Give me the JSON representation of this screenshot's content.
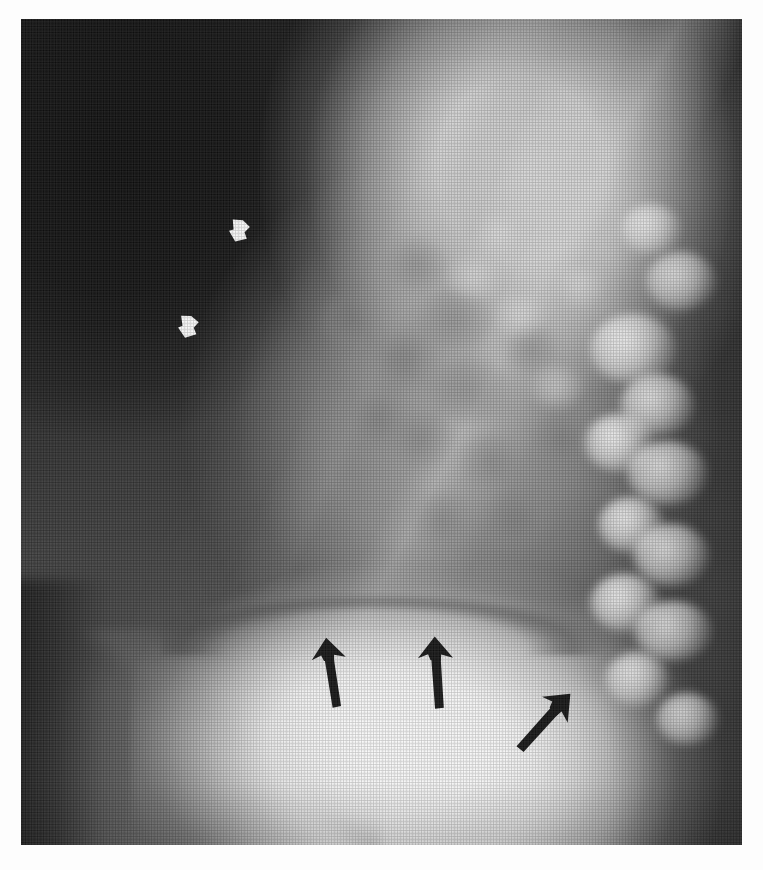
{
  "figure": {
    "modality": "x-ray",
    "view": "lateral chest radiograph",
    "background_color": "#fdfdfd",
    "plate": {
      "left": 21,
      "top": 19,
      "width": 721,
      "height": 826,
      "dark_value": "#151515",
      "bright_value": "#ffffff"
    }
  },
  "annotations": {
    "white_arrowheads": [
      {
        "id": "white-arrowhead-upper",
        "label": "upper white arrowhead",
        "color": "#ffffff",
        "x": 203,
        "y": 196,
        "size": 30,
        "rotation": 112,
        "points_to": "anterior chest wall interface"
      },
      {
        "id": "white-arrowhead-lower",
        "label": "lower white arrowhead",
        "color": "#ffffff",
        "x": 152,
        "y": 292,
        "size": 30,
        "rotation": 108,
        "points_to": "anterior chest wall interface"
      }
    ],
    "black_arrows": [
      {
        "id": "black-arrow-left",
        "label": "left black arrow",
        "color": "#141414",
        "x": 291,
        "y": 618,
        "length": 72,
        "rotation": -7,
        "points_to": "diaphragmatic surface"
      },
      {
        "id": "black-arrow-center",
        "label": "center black arrow",
        "color": "#141414",
        "x": 396,
        "y": 617,
        "length": 74,
        "rotation": -2,
        "points_to": "diaphragmatic surface"
      },
      {
        "id": "black-arrow-right",
        "label": "right black arrow",
        "color": "#141414",
        "x": 503,
        "y": 664,
        "length": 76,
        "rotation": 44,
        "points_to": "posterior diaphragmatic surface"
      }
    ]
  },
  "anatomy": {
    "regions": [
      {
        "name": "retrosternal-lung-field",
        "tone": "dark",
        "x": 90,
        "y": 140
      },
      {
        "name": "mediastinum-heart",
        "tone": "bright",
        "x": 500,
        "y": 150
      },
      {
        "name": "pulmonary-vasculature",
        "tone": "mottled-gray",
        "x": 430,
        "y": 400
      },
      {
        "name": "thoracic-vertebrae",
        "tone": "bright-nodular",
        "x": 640,
        "y": 500
      },
      {
        "name": "diaphragm-dome",
        "tone": "bright",
        "x": 360,
        "y": 725
      },
      {
        "name": "gastric-bubble",
        "tone": "mid-gray",
        "x": 150,
        "y": 760
      }
    ],
    "bone_blobs": [
      {
        "x": 612,
        "y": 330,
        "w": 86,
        "h": 70
      },
      {
        "x": 636,
        "y": 386,
        "w": 74,
        "h": 62
      },
      {
        "x": 598,
        "y": 424,
        "w": 70,
        "h": 58
      },
      {
        "x": 646,
        "y": 454,
        "w": 80,
        "h": 64
      },
      {
        "x": 610,
        "y": 506,
        "w": 66,
        "h": 56
      },
      {
        "x": 650,
        "y": 536,
        "w": 76,
        "h": 62
      },
      {
        "x": 604,
        "y": 584,
        "w": 70,
        "h": 58
      },
      {
        "x": 652,
        "y": 612,
        "w": 78,
        "h": 60
      },
      {
        "x": 616,
        "y": 660,
        "w": 64,
        "h": 54
      },
      {
        "x": 660,
        "y": 262,
        "w": 70,
        "h": 58
      },
      {
        "x": 630,
        "y": 210,
        "w": 60,
        "h": 50
      },
      {
        "x": 666,
        "y": 700,
        "w": 62,
        "h": 52
      }
    ],
    "vascular_blobs": [
      {
        "x": 396,
        "y": 246,
        "w": 64,
        "h": 52
      },
      {
        "x": 434,
        "y": 300,
        "w": 78,
        "h": 60
      },
      {
        "x": 382,
        "y": 338,
        "w": 70,
        "h": 56
      },
      {
        "x": 448,
        "y": 372,
        "w": 86,
        "h": 64
      },
      {
        "x": 400,
        "y": 420,
        "w": 72,
        "h": 58
      },
      {
        "x": 470,
        "y": 442,
        "w": 66,
        "h": 54
      },
      {
        "x": 356,
        "y": 400,
        "w": 60,
        "h": 50
      },
      {
        "x": 510,
        "y": 330,
        "w": 58,
        "h": 48
      },
      {
        "x": 330,
        "y": 300,
        "w": 64,
        "h": 54
      },
      {
        "x": 494,
        "y": 500,
        "w": 74,
        "h": 58
      },
      {
        "x": 420,
        "y": 500,
        "w": 64,
        "h": 52
      },
      {
        "x": 540,
        "y": 420,
        "w": 62,
        "h": 50
      }
    ],
    "hilar_blobs": [
      {
        "x": 452,
        "y": 258,
        "w": 54,
        "h": 44
      },
      {
        "x": 498,
        "y": 296,
        "w": 50,
        "h": 42
      },
      {
        "x": 478,
        "y": 214,
        "w": 46,
        "h": 38
      },
      {
        "x": 536,
        "y": 368,
        "w": 52,
        "h": 42
      },
      {
        "x": 558,
        "y": 266,
        "w": 48,
        "h": 40
      }
    ]
  }
}
